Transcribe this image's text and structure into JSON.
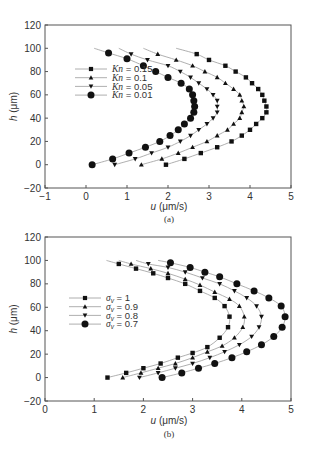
{
  "chart_data": [
    {
      "id": "a",
      "type": "scatter",
      "caption": "(a)",
      "title": "",
      "xlabel": "u (μm/s)",
      "xlabel_italic": "u",
      "xlabel_unit": "(μm/s)",
      "ylabel": "h (μm)",
      "ylabel_italic": "h",
      "ylabel_unit": "(μm)",
      "xlim": [
        -1,
        5
      ],
      "ylim": [
        -20,
        120
      ],
      "xticks": [
        -1,
        0,
        1,
        2,
        3,
        4,
        5
      ],
      "yticks": [
        -20,
        0,
        20,
        40,
        60,
        80,
        100,
        120
      ],
      "grid": false,
      "legend_position": "center-left",
      "series": [
        {
          "name": "Kn = 0.15",
          "legend_var": "Kn",
          "legend_value": "0.15",
          "marker": "square",
          "x": [
            1.95,
            2.4,
            2.8,
            3.2,
            3.55,
            3.8,
            4.0,
            4.15,
            4.3,
            4.4,
            4.4,
            4.35,
            4.3,
            4.2,
            4.05,
            3.9,
            3.65,
            3.4,
            3.0,
            2.7
          ],
          "y": [
            0,
            5,
            10,
            15,
            20,
            25,
            30,
            35,
            40,
            45,
            50,
            55,
            60,
            65,
            70,
            75,
            80,
            85,
            90,
            95
          ],
          "line_start": [
            2.2,
            100
          ]
        },
        {
          "name": "Kn = 0.1",
          "legend_var": "Kn",
          "legend_value": "0.1",
          "marker": "triangle-up",
          "x": [
            1.35,
            1.85,
            2.25,
            2.6,
            2.95,
            3.2,
            3.45,
            3.6,
            3.75,
            3.8,
            3.85,
            3.8,
            3.75,
            3.6,
            3.4,
            3.2,
            2.9,
            2.6,
            2.2,
            1.75
          ],
          "y": [
            0,
            5,
            10,
            15,
            20,
            25,
            30,
            35,
            40,
            45,
            50,
            55,
            60,
            65,
            70,
            75,
            80,
            85,
            90,
            95
          ],
          "line_start": [
            1.4,
            100
          ]
        },
        {
          "name": "Kn = 0.05",
          "legend_var": "Kn",
          "legend_value": "0.05",
          "marker": "triangle-down",
          "x": [
            0.7,
            1.2,
            1.6,
            2.0,
            2.3,
            2.55,
            2.75,
            2.95,
            3.1,
            3.2,
            3.2,
            3.2,
            3.1,
            2.95,
            2.75,
            2.55,
            2.3,
            2.0,
            1.5,
            1.1
          ],
          "y": [
            0,
            5,
            10,
            15,
            20,
            25,
            30,
            35,
            40,
            45,
            50,
            55,
            60,
            65,
            70,
            75,
            80,
            85,
            90,
            95
          ],
          "line_start": [
            0.8,
            100
          ]
        },
        {
          "name": "Kn = 0.01",
          "legend_var": "Kn",
          "legend_value": "0.01",
          "marker": "circle",
          "x": [
            0.15,
            0.65,
            1.05,
            1.45,
            1.8,
            2.05,
            2.25,
            2.4,
            2.55,
            2.63,
            2.65,
            2.63,
            2.6,
            2.52,
            2.32,
            2.0,
            1.7,
            1.4,
            1.0,
            0.55
          ],
          "y": [
            0,
            5,
            10,
            15,
            20,
            25,
            30,
            35,
            40,
            45,
            50,
            55,
            60,
            65,
            70,
            75,
            80,
            85,
            91,
            96
          ],
          "line_start": [
            0.2,
            100
          ]
        }
      ]
    },
    {
      "id": "b",
      "type": "scatter",
      "caption": "(b)",
      "title": "",
      "xlabel": "u (μm/s)",
      "xlabel_italic": "u",
      "xlabel_unit": "(μm/s)",
      "ylabel": "h (μm)",
      "ylabel_italic": "h",
      "ylabel_unit": "(μm)",
      "xlim": [
        0,
        5
      ],
      "ylim": [
        -20,
        120
      ],
      "xticks": [
        0,
        1,
        2,
        3,
        4,
        5
      ],
      "yticks": [
        -20,
        0,
        20,
        40,
        60,
        80,
        100,
        120
      ],
      "grid": false,
      "legend_position": "center-left",
      "series": [
        {
          "name": "σv = 1",
          "legend_var": "σ",
          "legend_sub": "v",
          "legend_value": "1",
          "marker": "square",
          "x": [
            1.27,
            1.65,
            2.0,
            2.35,
            2.7,
            3.0,
            3.3,
            3.55,
            3.72,
            3.75,
            3.65,
            3.45,
            3.15,
            2.85,
            2.5,
            2.2,
            1.85,
            1.5
          ],
          "y": [
            0,
            4,
            8,
            12,
            17,
            21,
            26,
            34,
            43,
            52,
            61,
            68,
            74,
            80,
            85,
            89,
            93,
            97
          ],
          "line_start": [
            1.25,
            100
          ]
        },
        {
          "name": "σv = 0.9",
          "legend_var": "σ",
          "legend_sub": "v",
          "legend_value": "0.9",
          "marker": "triangle-up",
          "x": [
            1.58,
            1.95,
            2.3,
            2.65,
            3.0,
            3.3,
            3.6,
            3.85,
            4.02,
            4.05,
            3.95,
            3.75,
            3.45,
            3.15,
            2.85,
            2.5,
            2.15,
            1.75
          ],
          "y": [
            0,
            4,
            8,
            12,
            17,
            22,
            27,
            34,
            43,
            52,
            61,
            67,
            73,
            79,
            84,
            89,
            93,
            97
          ],
          "line_start": [
            1.5,
            100
          ]
        },
        {
          "name": "σv = 0.8",
          "legend_var": "σ",
          "legend_sub": "v",
          "legend_value": "0.8",
          "marker": "triangle-down",
          "x": [
            1.92,
            2.3,
            2.65,
            3.0,
            3.35,
            3.65,
            3.95,
            4.2,
            4.35,
            4.4,
            4.3,
            4.1,
            3.85,
            3.55,
            3.2,
            2.85,
            2.5,
            2.1
          ],
          "y": [
            0,
            4,
            8,
            12,
            17,
            22,
            28,
            35,
            43,
            52,
            61,
            68,
            74,
            80,
            85,
            90,
            94,
            97
          ],
          "line_start": [
            1.85,
            100
          ]
        },
        {
          "name": "σv = 0.7",
          "legend_var": "σ",
          "legend_sub": "v",
          "legend_value": "0.7",
          "marker": "circle",
          "x": [
            2.38,
            2.78,
            3.12,
            3.45,
            3.8,
            4.1,
            4.4,
            4.65,
            4.82,
            4.88,
            4.8,
            4.55,
            4.25,
            3.9,
            3.55,
            3.25,
            2.95,
            2.55
          ],
          "y": [
            0,
            4,
            8,
            12,
            17,
            22,
            28,
            35,
            43,
            52,
            61,
            68,
            74,
            80,
            86,
            90,
            94,
            98
          ],
          "line_start": [
            2.3,
            100
          ]
        }
      ]
    }
  ],
  "colors": {
    "marker": "#111111",
    "line": "#9a9a9a",
    "axis": "#555555",
    "text": "#333333"
  }
}
